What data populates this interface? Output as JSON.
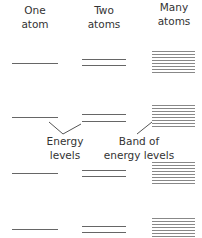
{
  "headers": {
    "one": {
      "line1": "One",
      "line2": "atom"
    },
    "two": {
      "line1": "Two",
      "line2": "atoms"
    },
    "many": {
      "line1": "Many",
      "line2": "atoms"
    }
  },
  "annotations": {
    "energy_levels": {
      "line1": "Energy",
      "line2": "levels"
    },
    "band": {
      "line1": "Band of",
      "line2": "energy levels"
    }
  },
  "colors": {
    "line": "#666666",
    "band": "#888888",
    "text": "#333333"
  }
}
